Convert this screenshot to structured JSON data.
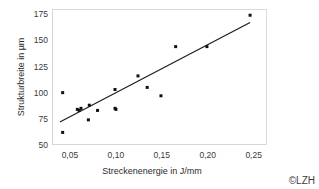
{
  "chart_data": {
    "type": "scatter",
    "title": "",
    "xlabel": "Streckenenergie in J/mm",
    "ylabel": "Strukturbreite in µm",
    "xlim": [
      0.0305,
      0.2645
    ],
    "ylim": [
      50,
      180
    ],
    "xticks": [
      0.05,
      0.1,
      0.15,
      0.2,
      0.25
    ],
    "xticklabels": [
      "0,05",
      "0,10",
      "0,15",
      "0,20",
      "0,25"
    ],
    "yticks": [
      50,
      75,
      100,
      125,
      150,
      175
    ],
    "yticklabels": [
      "50",
      "75",
      "100",
      "125",
      "150",
      "175"
    ],
    "grid": false,
    "legend": null,
    "marker": "square",
    "marker_color": "#111111",
    "series": [
      {
        "name": "Messpunkte",
        "x": [
          0.041,
          0.041,
          0.057,
          0.059,
          0.061,
          0.069,
          0.07,
          0.079,
          0.098,
          0.098,
          0.099,
          0.123,
          0.133,
          0.148,
          0.164,
          0.198,
          0.245
        ],
        "y": [
          101,
          63,
          85,
          84,
          86,
          75,
          89,
          84,
          104,
          86,
          85,
          117,
          106,
          98,
          145,
          145,
          175
        ]
      }
    ],
    "trendline": {
      "name": "Ausgleichsgerade",
      "x": [
        0.038,
        0.245
      ],
      "y": [
        73,
        168
      ],
      "color": "#1a1a1a"
    }
  },
  "copyright": {
    "text": "©LZH"
  }
}
